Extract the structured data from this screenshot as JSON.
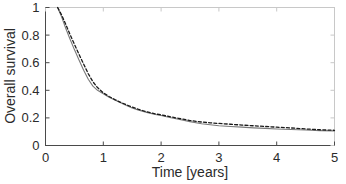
{
  "chart_data": {
    "type": "line",
    "title": "",
    "xlabel": "Time [years]",
    "ylabel": "Overall survival",
    "xlim": [
      0,
      5
    ],
    "ylim": [
      0,
      1
    ],
    "xticks": [
      0,
      1,
      2,
      3,
      4,
      5
    ],
    "xticklabels": [
      "0",
      "1",
      "2",
      "3",
      "4",
      "5"
    ],
    "yticks": [
      0,
      0.2,
      0.4,
      0.6,
      0.8,
      1
    ],
    "yticklabels": [
      "0",
      "0.2",
      "0.4",
      "0.6",
      "0.8",
      "1"
    ],
    "grid": false,
    "legend": null,
    "series": [
      {
        "name": "observed-survival",
        "style": "solid",
        "color": "#7a7a7a",
        "width": 1.1,
        "x": [
          0.21,
          0.28,
          0.35,
          0.42,
          0.5,
          0.58,
          0.66,
          0.74,
          0.82,
          0.9,
          1.0,
          1.1,
          1.2,
          1.3,
          1.4,
          1.5,
          1.6,
          1.75,
          1.9,
          2.0,
          2.15,
          2.3,
          2.5,
          2.7,
          2.85,
          3.0,
          3.2,
          3.4,
          3.6,
          3.8,
          4.0,
          4.25,
          4.5,
          4.75,
          5.0
        ],
        "y": [
          1.0,
          0.93,
          0.85,
          0.775,
          0.695,
          0.62,
          0.545,
          0.48,
          0.43,
          0.4,
          0.375,
          0.35,
          0.33,
          0.31,
          0.29,
          0.272,
          0.258,
          0.24,
          0.225,
          0.218,
          0.203,
          0.19,
          0.173,
          0.158,
          0.15,
          0.143,
          0.138,
          0.133,
          0.128,
          0.124,
          0.12,
          0.116,
          0.112,
          0.108,
          0.105
        ]
      },
      {
        "name": "model-predicted-survival",
        "style": "dashed",
        "color": "#1a1a1a",
        "width": 1.3,
        "x": [
          0.21,
          0.28,
          0.35,
          0.42,
          0.5,
          0.58,
          0.66,
          0.74,
          0.82,
          0.9,
          1.0,
          1.1,
          1.2,
          1.3,
          1.4,
          1.5,
          1.6,
          1.75,
          1.9,
          2.0,
          2.15,
          2.3,
          2.5,
          2.7,
          2.85,
          3.0,
          3.2,
          3.4,
          3.6,
          3.8,
          4.0,
          4.25,
          4.5,
          4.75,
          5.0
        ],
        "y": [
          1.0,
          0.945,
          0.878,
          0.808,
          0.733,
          0.66,
          0.59,
          0.52,
          0.462,
          0.42,
          0.382,
          0.355,
          0.333,
          0.313,
          0.295,
          0.278,
          0.263,
          0.244,
          0.229,
          0.222,
          0.209,
          0.197,
          0.181,
          0.17,
          0.164,
          0.16,
          0.154,
          0.148,
          0.143,
          0.138,
          0.133,
          0.127,
          0.12,
          0.114,
          0.11
        ]
      }
    ],
    "axes_style": {
      "box": true,
      "tick_direction": "in",
      "frame_color_primary": "#3d3d3d",
      "frame_color_secondary": "#c8c8c8"
    }
  }
}
